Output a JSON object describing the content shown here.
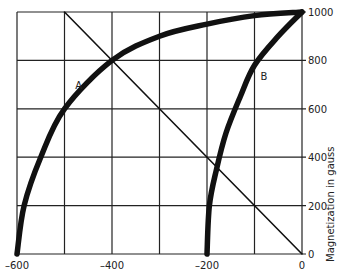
{
  "chart_data": {
    "type": "line",
    "title": "",
    "xlabel": "",
    "ylabel": "Magnetization in gauss",
    "xlim": [
      -600,
      0
    ],
    "ylim": [
      0,
      1000
    ],
    "grid": true,
    "x_ticks": [
      "-600",
      "-400",
      "-200",
      "0"
    ],
    "y_ticks": [
      "0",
      "200",
      "400",
      "600",
      "800",
      "1000"
    ],
    "series": [
      {
        "name": "A",
        "style": "thick",
        "points": [
          [
            -600,
            0
          ],
          [
            -585,
            200
          ],
          [
            -550,
            400
          ],
          [
            -500,
            600
          ],
          [
            -400,
            800
          ],
          [
            -300,
            900
          ],
          [
            -200,
            950
          ],
          [
            -100,
            985
          ],
          [
            0,
            1000
          ]
        ]
      },
      {
        "name": "B",
        "style": "thick",
        "points": [
          [
            -200,
            0
          ],
          [
            -195,
            200
          ],
          [
            -180,
            350
          ],
          [
            -160,
            500
          ],
          [
            -130,
            650
          ],
          [
            -100,
            780
          ],
          [
            -50,
            900
          ],
          [
            0,
            1000
          ]
        ]
      },
      {
        "name": "load line",
        "style": "thin",
        "points": [
          [
            -500,
            1000
          ],
          [
            0,
            0
          ]
        ]
      }
    ],
    "annotations": [
      {
        "text": "A",
        "x": -470,
        "y": 680
      },
      {
        "text": "B",
        "x": -80,
        "y": 720
      }
    ]
  }
}
